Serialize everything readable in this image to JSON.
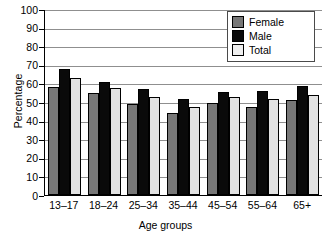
{
  "chart_data": {
    "type": "bar",
    "title": "",
    "xlabel": "Age groups",
    "ylabel": "Percentage",
    "categories": [
      "13–17",
      "18–24",
      "25–34",
      "35–44",
      "45–54",
      "55–64",
      "65+"
    ],
    "series": [
      {
        "name": "Female",
        "color": "#777777",
        "values": [
          58,
          55,
          49,
          44,
          49.5,
          47.5,
          51
        ]
      },
      {
        "name": "Male",
        "color": "#0a0a0a",
        "values": [
          68,
          60.5,
          57,
          51.5,
          55.5,
          56,
          58.5
        ]
      },
      {
        "name": "Total",
        "color": "#e2e2e2",
        "values": [
          63,
          57.5,
          52.5,
          47.5,
          52.5,
          51.5,
          54
        ]
      }
    ],
    "ylim": [
      0,
      100
    ],
    "ytick_values": [
      100,
      90,
      80,
      70,
      60,
      50,
      40,
      30,
      20,
      10,
      0
    ],
    "ytick_labels": [
      "100",
      "90",
      "80",
      "70",
      "60",
      "50",
      "40",
      "30",
      "20",
      "10",
      "0"
    ],
    "grid": true,
    "grid_axis": "y",
    "legend_position": "top-right",
    "legend_entries": [
      "Female",
      "Male",
      "Total"
    ]
  }
}
